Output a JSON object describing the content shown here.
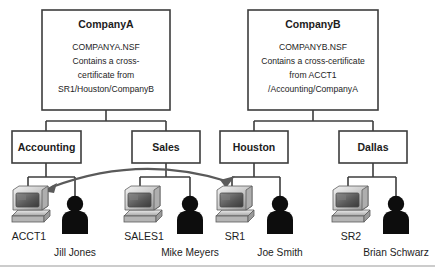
{
  "diagram": {
    "colors": {
      "box_stroke": "#3d3d3d",
      "box_fill": "#ffffff",
      "connector": "#3d3d3d",
      "arrow": "#5a5a5a",
      "text": "#1c1c1c",
      "person": "#0d0d0d",
      "background": "#ffffff",
      "footer_rule": "#9a9a9a"
    },
    "organizations": [
      {
        "id": "companya",
        "name": "CompanyA",
        "detail_lines": [
          "COMPANYA.NSF",
          "Contains a cross-",
          "certificate from",
          "SR1/Houston/CompanyB"
        ]
      },
      {
        "id": "companyb",
        "name": "CompanyB",
        "detail_lines": [
          "COMPANYB.NSF",
          "Contains a cross-certificate",
          "from ACCT1",
          "/Accounting/CompanyA"
        ]
      }
    ],
    "org_units": [
      {
        "id": "accounting",
        "label": "Accounting",
        "parent": "companya"
      },
      {
        "id": "sales",
        "label": "Sales",
        "parent": "companya"
      },
      {
        "id": "houston",
        "label": "Houston",
        "parent": "companyb"
      },
      {
        "id": "dallas",
        "label": "Dallas",
        "parent": "companyb"
      }
    ],
    "endpoints": [
      {
        "id": "acct1",
        "server": "ACCT1",
        "person": "Jill Jones",
        "parent": "accounting"
      },
      {
        "id": "sales1",
        "server": "SALES1",
        "person": "Mike Meyers",
        "parent": "sales"
      },
      {
        "id": "sr1",
        "server": "SR1",
        "person": "Joe Smith",
        "parent": "houston"
      },
      {
        "id": "sr2",
        "server": "SR2",
        "person": "Brian Schwarz",
        "parent": "dallas"
      }
    ],
    "trust_link": {
      "from": "acct1",
      "to": "sr1",
      "bidirectional": true,
      "style": "curved-arc"
    }
  }
}
